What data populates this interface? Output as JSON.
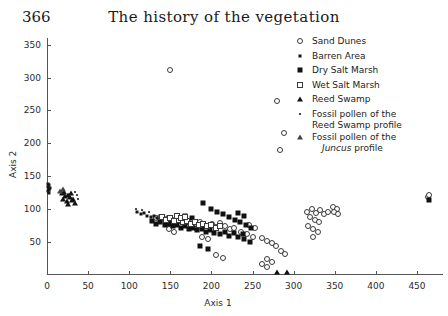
{
  "header": {
    "page_number": "366",
    "title": "The history of the vegetation"
  },
  "legend": {
    "items": [
      {
        "label": "Sand Dunes",
        "marker": "open-circle"
      },
      {
        "label": "Barren Area",
        "marker": "small-filled-square"
      },
      {
        "label": "Dry Salt Marsh",
        "marker": "filled-square"
      },
      {
        "label": "Wet Salt Marsh",
        "marker": "open-square"
      },
      {
        "label": "Reed Swamp",
        "marker": "filled-triangle"
      },
      {
        "label": "Fossil pollen of the",
        "label2": "Reed Swamp profile",
        "marker": "dot"
      },
      {
        "label": "Fossil pollen of the",
        "label2": "Juncus profile",
        "label2_italic_word": "Juncus",
        "marker": "open-triangle"
      }
    ]
  },
  "chart_data": {
    "type": "scatter",
    "title": "The history of the vegetation",
    "xlabel": "Axis 1",
    "ylabel": "Axis 2",
    "xlim": [
      0,
      480
    ],
    "ylim": [
      0,
      360
    ],
    "xticks": [
      0,
      50,
      100,
      150,
      200,
      250,
      300,
      350,
      400,
      450
    ],
    "yticks": [
      50,
      100,
      150,
      200,
      250,
      300,
      350
    ],
    "grid": false,
    "legend_position": "top-right",
    "series": [
      {
        "name": "Sand Dunes",
        "marker": "open-circle",
        "points": [
          [
            150,
            312
          ],
          [
            280,
            265
          ],
          [
            288,
            215
          ],
          [
            283,
            190
          ],
          [
            132,
            86
          ],
          [
            137,
            88
          ],
          [
            142,
            84
          ],
          [
            147,
            86
          ],
          [
            152,
            83
          ],
          [
            157,
            85
          ],
          [
            162,
            82
          ],
          [
            167,
            84
          ],
          [
            171,
            80
          ],
          [
            176,
            82
          ],
          [
            181,
            78
          ],
          [
            186,
            80
          ],
          [
            191,
            76
          ],
          [
            196,
            74
          ],
          [
            201,
            77
          ],
          [
            206,
            73
          ],
          [
            211,
            79
          ],
          [
            216,
            75
          ],
          [
            222,
            70
          ],
          [
            228,
            72
          ],
          [
            236,
            66
          ],
          [
            243,
            62
          ],
          [
            250,
            58
          ],
          [
            246,
            76
          ],
          [
            253,
            72
          ],
          [
            262,
            56
          ],
          [
            268,
            52
          ],
          [
            274,
            48
          ],
          [
            279,
            44
          ],
          [
            284,
            36
          ],
          [
            289,
            32
          ],
          [
            268,
            24
          ],
          [
            274,
            20
          ],
          [
            262,
            16
          ],
          [
            268,
            12
          ],
          [
            316,
            96
          ],
          [
            322,
            100
          ],
          [
            327,
            94
          ],
          [
            332,
            98
          ],
          [
            337,
            92
          ],
          [
            342,
            96
          ],
          [
            320,
            88
          ],
          [
            326,
            84
          ],
          [
            331,
            80
          ],
          [
            318,
            74
          ],
          [
            324,
            70
          ],
          [
            330,
            66
          ],
          [
            323,
            58
          ],
          [
            348,
            104
          ],
          [
            353,
            100
          ],
          [
            349,
            96
          ],
          [
            354,
            92
          ],
          [
            463,
            118
          ],
          [
            465,
            122
          ],
          [
            205,
            30
          ],
          [
            214,
            26
          ],
          [
            148,
            70
          ],
          [
            155,
            66
          ],
          [
            188,
            58
          ],
          [
            196,
            54
          ]
        ]
      },
      {
        "name": "Barren Area",
        "marker": "small-filled-square",
        "points": [
          [
            1,
            133
          ],
          [
            2,
            130
          ],
          [
            3,
            136
          ],
          [
            1,
            127
          ],
          [
            4,
            132
          ],
          [
            2,
            124
          ],
          [
            3,
            129
          ],
          [
            1,
            138
          ],
          [
            110,
            96
          ],
          [
            114,
            92
          ],
          [
            118,
            94
          ],
          [
            122,
            90
          ],
          [
            126,
            88
          ],
          [
            130,
            90
          ],
          [
            134,
            86
          ],
          [
            138,
            88
          ],
          [
            142,
            84
          ],
          [
            146,
            86
          ],
          [
            150,
            82
          ],
          [
            154,
            84
          ]
        ]
      },
      {
        "name": "Dry Salt Marsh",
        "marker": "filled-square",
        "points": [
          [
            128,
            82
          ],
          [
            133,
            78
          ],
          [
            138,
            80
          ],
          [
            143,
            76
          ],
          [
            148,
            78
          ],
          [
            153,
            74
          ],
          [
            158,
            76
          ],
          [
            163,
            72
          ],
          [
            168,
            74
          ],
          [
            173,
            70
          ],
          [
            178,
            72
          ],
          [
            183,
            68
          ],
          [
            188,
            70
          ],
          [
            193,
            66
          ],
          [
            198,
            68
          ],
          [
            203,
            64
          ],
          [
            210,
            62
          ],
          [
            216,
            66
          ],
          [
            221,
            60
          ],
          [
            227,
            64
          ],
          [
            232,
            58
          ],
          [
            238,
            62
          ],
          [
            190,
            110
          ],
          [
            200,
            100
          ],
          [
            207,
            96
          ],
          [
            214,
            92
          ],
          [
            221,
            88
          ],
          [
            229,
            84
          ],
          [
            235,
            80
          ],
          [
            242,
            76
          ],
          [
            248,
            72
          ],
          [
            186,
            44
          ],
          [
            196,
            40
          ],
          [
            240,
            54
          ],
          [
            247,
            50
          ],
          [
            465,
            114
          ],
          [
            168,
            90
          ],
          [
            176,
            86
          ],
          [
            232,
            94
          ],
          [
            239,
            90
          ]
        ]
      },
      {
        "name": "Wet Salt Marsh",
        "marker": "open-square",
        "points": [
          [
            140,
            88
          ],
          [
            145,
            84
          ],
          [
            150,
            86
          ],
          [
            155,
            82
          ],
          [
            160,
            84
          ],
          [
            165,
            80
          ],
          [
            170,
            82
          ],
          [
            175,
            78
          ],
          [
            180,
            80
          ],
          [
            185,
            76
          ],
          [
            190,
            78
          ],
          [
            195,
            74
          ],
          [
            200,
            76
          ],
          [
            205,
            72
          ],
          [
            210,
            74
          ],
          [
            158,
            90
          ],
          [
            163,
            86
          ],
          [
            168,
            88
          ]
        ]
      },
      {
        "name": "Reed Swamp",
        "marker": "filled-triangle",
        "points": [
          [
            18,
            124
          ],
          [
            22,
            120
          ],
          [
            26,
            122
          ],
          [
            20,
            116
          ],
          [
            24,
            112
          ],
          [
            28,
            118
          ],
          [
            30,
            114
          ],
          [
            26,
            108
          ],
          [
            32,
            116
          ],
          [
            34,
            110
          ],
          [
            21,
            126
          ],
          [
            29,
            124
          ],
          [
            280,
            5
          ],
          [
            292,
            5
          ]
        ]
      },
      {
        "name": "Fossil pollen of the Reed Swamp profile",
        "marker": "dot",
        "points": [
          [
            36,
            122
          ],
          [
            38,
            116
          ],
          [
            34,
            126
          ],
          [
            108,
            100
          ],
          [
            116,
            98
          ],
          [
            124,
            96
          ]
        ]
      },
      {
        "name": "Fossil pollen of the Juncus profile",
        "marker": "open-triangle",
        "points": [
          [
            16,
            128
          ],
          [
            19,
            131
          ]
        ]
      }
    ]
  }
}
